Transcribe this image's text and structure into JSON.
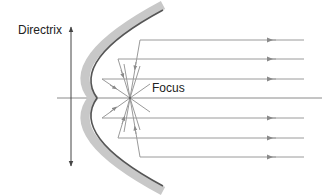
{
  "figure": {
    "type": "parabolic-reflector-diagram",
    "labels": {
      "directrix": "Directrix",
      "focus": "Focus"
    },
    "colors": {
      "background": "#ffffff",
      "reflector_band": "#c8c8c8",
      "reflector_edge": "#555555",
      "rays": "#9a9a9a",
      "axis": "#8a8a8a",
      "directrix_line": "#444444",
      "text": "#222222"
    },
    "geometry": {
      "axis_y": 98,
      "focus": {
        "x": 130,
        "y": 98
      },
      "vertex_x": 97,
      "directrix_x": 71,
      "incoming_ray_ys": [
        40,
        59,
        79,
        118,
        138,
        157
      ],
      "ray_right_x": 304,
      "arrowhead_x": 272
    }
  }
}
